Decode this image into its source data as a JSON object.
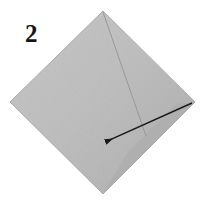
{
  "figure": {
    "kind": "origami-fold-diagram",
    "step_label": "2",
    "width": 207,
    "height": 201,
    "background_color": "#ffffff"
  },
  "paper": {
    "name": "square-sheet-diamond",
    "shape": "square rotated 45 degrees",
    "fill_color": "#bdbdbd",
    "fill_color_light": "#c6c6c6",
    "fill_color_dark": "#b0b0b0",
    "edge_color": "#a8a8a8",
    "vertices": {
      "top": [
        103,
        11
      ],
      "right": [
        195,
        102
      ],
      "bottom": [
        103,
        194
      ],
      "left": [
        10,
        102
      ]
    }
  },
  "crease": {
    "name": "diagonal-crease-line",
    "color": "#8e8e8e",
    "from": [
      103,
      12
    ],
    "to": [
      146,
      136
    ]
  },
  "arrow": {
    "name": "fold-direction-arrow",
    "color": "#1a1a1a",
    "tail": [
      192,
      103
    ],
    "head": [
      103,
      143
    ],
    "stroke_width": 1.4,
    "head_size": 7
  },
  "colors": {
    "ink": "#141414",
    "paper_gray": "#bdbdbd",
    "line_gray": "#8e8e8e",
    "white": "#ffffff"
  }
}
